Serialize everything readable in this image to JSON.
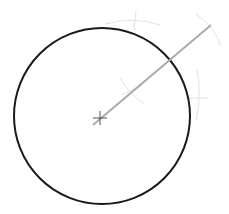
{
  "diagram": {
    "type": "geometric-construction",
    "colors": {
      "circle": "#1a1a1a",
      "radial_line": "#aaaaaa",
      "center_mark": "#555555",
      "construction_arcs": "#e2e2e2"
    },
    "circle": {
      "cx": 102,
      "cy": 116,
      "r": 88
    },
    "center_mark": {
      "x": 100,
      "y": 118,
      "size": 7
    },
    "radial_line": {
      "x1": 93,
      "y1": 125,
      "x2": 211,
      "y2": 25
    },
    "construction_arcs": [
      {
        "d": "M 105 24 Q 135 16 160 25"
      },
      {
        "d": "M 136 11 L 134 30"
      },
      {
        "d": "M 196 14 Q 213 25 221 46"
      },
      {
        "d": "M 120 78 Q 128 92 144 104"
      },
      {
        "d": "M 122 95 L 142 85"
      },
      {
        "d": "M 197 70 Q 202 95 196 120"
      },
      {
        "d": "M 186 98 L 208 98"
      }
    ]
  }
}
